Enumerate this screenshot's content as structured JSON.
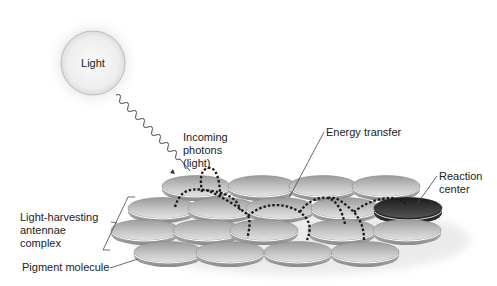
{
  "diagram": {
    "light_source": {
      "label": "Light"
    },
    "labels": {
      "incoming_photons": [
        "Incoming",
        "photons",
        "(light)"
      ],
      "energy_transfer": "Energy transfer",
      "reaction_center": [
        "Reaction",
        "center"
      ],
      "antenna_complex": [
        "Light-harvesting",
        "antennae",
        "complex"
      ],
      "pigment_molecule": "Pigment molecule"
    },
    "colors": {
      "disc_light": "#e2e2e2",
      "disc_mid": "#a9a9a9",
      "disc_dark": "#555555",
      "reaction_center": "#2a2a2a",
      "energy_path": "#1a1a1a",
      "leader_line": "#444444"
    },
    "pigment_rows": [
      {
        "y": 186,
        "x": [
          196,
          262,
          323,
          386
        ]
      },
      {
        "y": 208,
        "x": [
          162,
          222,
          280,
          345
        ]
      },
      {
        "y": 230,
        "x": [
          145,
          207,
          264,
          342,
          407
        ]
      },
      {
        "y": 252,
        "x": [
          168,
          230,
          298,
          365
        ]
      }
    ],
    "reaction_center_disc": {
      "x": 408,
      "y": 208
    }
  }
}
